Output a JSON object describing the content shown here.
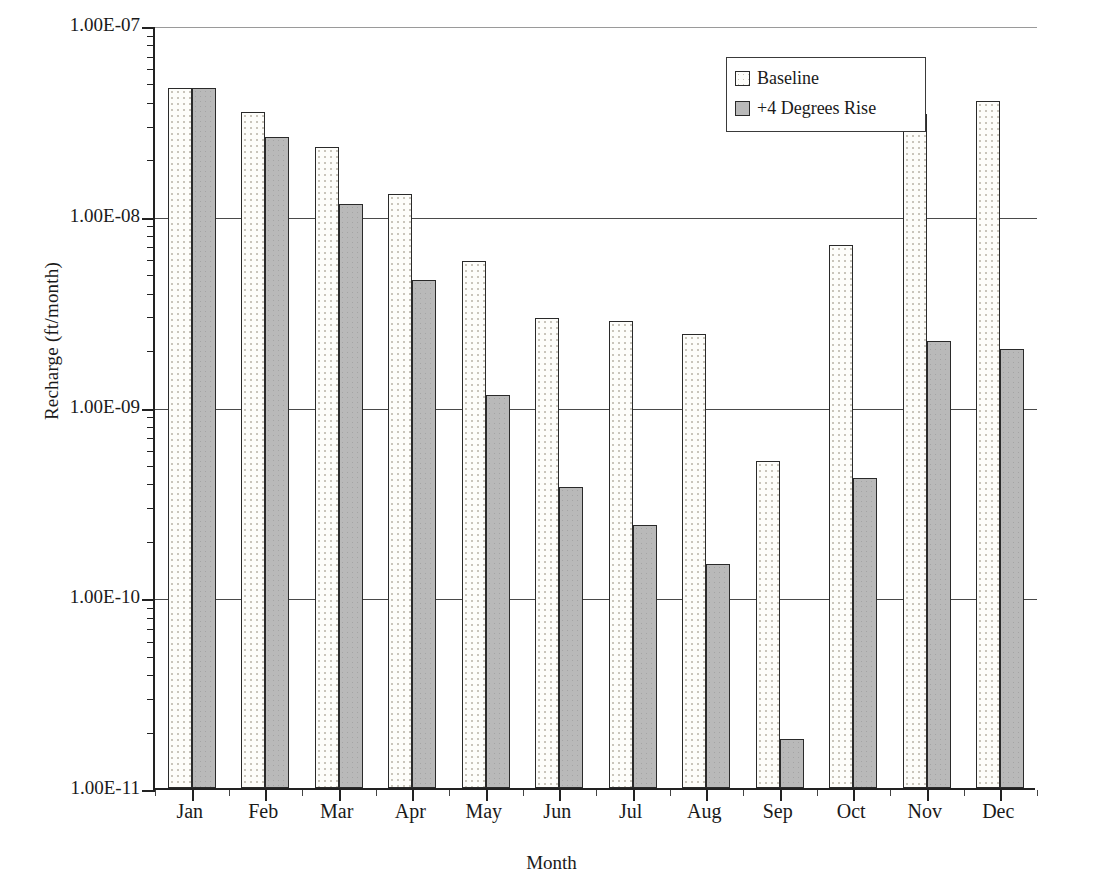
{
  "chart_data": {
    "type": "bar",
    "title": "",
    "xlabel": "Month",
    "ylabel": "Recharge (ft/month)",
    "yscale": "log",
    "ylim": [
      1e-11,
      1e-07
    ],
    "ytick_labels": [
      "1.00E-07",
      "1.00E-08",
      "1.00E-09",
      "1.00E-10",
      "1.00E-11"
    ],
    "ytick_values": [
      1e-07,
      1e-08,
      1e-09,
      1e-10,
      1e-11
    ],
    "grid": "horizontal",
    "legend_position": "top-right",
    "categories": [
      "Jan",
      "Feb",
      "Mar",
      "Apr",
      "May",
      "Jun",
      "Jul",
      "Aug",
      "Sep",
      "Oct",
      "Nov",
      "Dec"
    ],
    "series": [
      {
        "name": "Baseline",
        "fill": "dotted-white",
        "color": "#fdfdfa",
        "values": [
          4.7e-08,
          3.5e-08,
          2.3e-08,
          1.3e-08,
          5.8e-09,
          2.9e-09,
          2.8e-09,
          2.4e-09,
          5.2e-10,
          7e-09,
          3.4e-08,
          4e-08
        ]
      },
      {
        "name": "+4 Degrees Rise",
        "fill": "solid-gray",
        "color": "#b9b9b9",
        "values": [
          4.7e-08,
          2.6e-08,
          1.15e-08,
          4.6e-09,
          1.15e-09,
          3.8e-10,
          2.4e-10,
          1.5e-10,
          1.8e-11,
          4.2e-10,
          2.2e-09,
          2e-09
        ]
      }
    ]
  },
  "legend": {
    "items": [
      {
        "label": "Baseline",
        "swatch": "baseline"
      },
      {
        "label": "+4 Degrees Rise",
        "swatch": "rise"
      }
    ]
  },
  "caption": ""
}
